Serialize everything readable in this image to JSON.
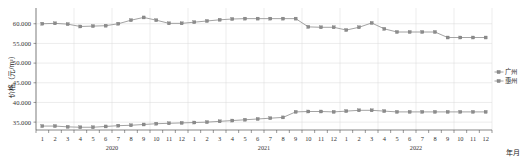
{
  "chart_data": {
    "type": "line",
    "title": "",
    "xlabel": "年月",
    "ylabel": "价格（元/m²）",
    "ylim": [
      33000,
      64000
    ],
    "yticks": [
      35000,
      40000,
      45000,
      50000,
      55000,
      60000
    ],
    "ytick_labels": [
      "35.000",
      "40.000",
      "45.000",
      "50.000",
      "55.000",
      "60.000"
    ],
    "grid": true,
    "legend_position": "right",
    "years": [
      {
        "label": "2020",
        "months": [
          "1",
          "2",
          "3",
          "4",
          "5",
          "6",
          "7",
          "8",
          "9",
          "10",
          "11",
          "12"
        ]
      },
      {
        "label": "2021",
        "months": [
          "1",
          "2",
          "3",
          "4",
          "5",
          "6",
          "7",
          "8",
          "9",
          "10",
          "11",
          "12"
        ]
      },
      {
        "label": "2022",
        "months": [
          "1",
          "2",
          "3",
          "4",
          "5",
          "6",
          "7",
          "8",
          "9",
          "10",
          "11",
          "12"
        ]
      }
    ],
    "x": [
      "2020-1",
      "2020-2",
      "2020-3",
      "2020-4",
      "2020-5",
      "2020-6",
      "2020-7",
      "2020-8",
      "2020-9",
      "2020-10",
      "2020-11",
      "2020-12",
      "2021-1",
      "2021-2",
      "2021-3",
      "2021-4",
      "2021-5",
      "2021-6",
      "2021-7",
      "2021-8",
      "2021-9",
      "2021-10",
      "2021-11",
      "2021-12",
      "2022-1",
      "2022-2",
      "2022-3",
      "2022-4",
      "2022-5",
      "2022-6",
      "2022-7",
      "2022-8",
      "2022-9",
      "2022-10",
      "2022-11",
      "2022-12"
    ],
    "series": [
      {
        "name": "广州",
        "marker": "square",
        "color": "#8c8c8c",
        "values": [
          60000,
          60100,
          59900,
          59300,
          59400,
          59500,
          60000,
          60900,
          61600,
          60900,
          60100,
          60100,
          60400,
          60700,
          61000,
          61200,
          61300,
          61300,
          61300,
          61300,
          61300,
          59200,
          59100,
          59100,
          58400,
          59100,
          60200,
          58700,
          57900,
          57900,
          57900,
          57900,
          56500,
          56500,
          56500,
          56500
        ]
      },
      {
        "name": "惠州",
        "marker": "square",
        "color": "#8c8c8c",
        "values": [
          34000,
          34000,
          33800,
          33700,
          33700,
          33900,
          34100,
          34200,
          34400,
          34600,
          34700,
          34800,
          34900,
          35000,
          35200,
          35400,
          35600,
          35800,
          36000,
          36200,
          37600,
          37700,
          37700,
          37600,
          37800,
          38000,
          38000,
          37800,
          37600,
          37600,
          37600,
          37600,
          37600,
          37600,
          37600,
          37600
        ]
      }
    ]
  },
  "legend": {
    "items": [
      {
        "label": "广州"
      },
      {
        "label": "惠州"
      }
    ]
  },
  "axes": {
    "y_title": "价格（元/m²）",
    "x_title": "年月"
  }
}
